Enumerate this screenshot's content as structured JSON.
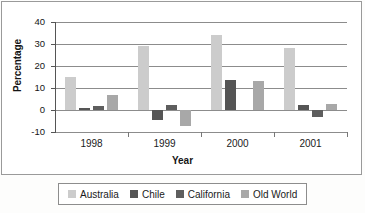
{
  "chart_data": {
    "type": "bar",
    "title": "",
    "xlabel": "Year",
    "ylabel": "Percentage",
    "categories": [
      "1998",
      "1999",
      "2000",
      "2001"
    ],
    "ylim": [
      -10,
      40
    ],
    "yticks": [
      40,
      30,
      20,
      10,
      0,
      -10
    ],
    "ytick_labels": [
      "40",
      "30",
      "20",
      "10",
      "0",
      "-10"
    ],
    "grid": true,
    "legend_position": "bottom",
    "series": [
      {
        "name": "Australia",
        "color": "#cccccc",
        "values": [
          15.2,
          29.3,
          34.0,
          28.4
        ]
      },
      {
        "name": "Chile",
        "color": "#555555",
        "values": [
          1.1,
          -4.4,
          13.5,
          2.1
        ]
      },
      {
        "name": "California",
        "color": "#5e5e5e",
        "values": [
          1.6,
          2.2,
          0.0,
          -3.2
        ]
      },
      {
        "name": "Old World",
        "color": "#a8a8a8",
        "values": [
          6.9,
          -7.3,
          13.0,
          2.6
        ]
      }
    ]
  }
}
